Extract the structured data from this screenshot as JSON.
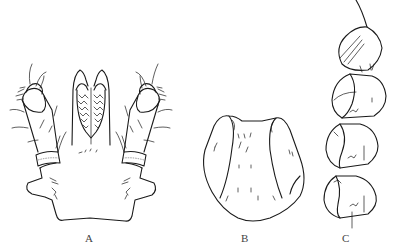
{
  "figure": {
    "panels": [
      {
        "id": "A",
        "label": "A",
        "subject": "gnathosoma with palps and basis capituli, dorsal view"
      },
      {
        "id": "B",
        "label": "B",
        "subject": "dorsal scutum / plate"
      },
      {
        "id": "C",
        "label": "C",
        "subject": "leg segments (tarsus–femur), lateral view"
      }
    ],
    "line_color": "#1a1a1a",
    "background": "#ffffff"
  }
}
